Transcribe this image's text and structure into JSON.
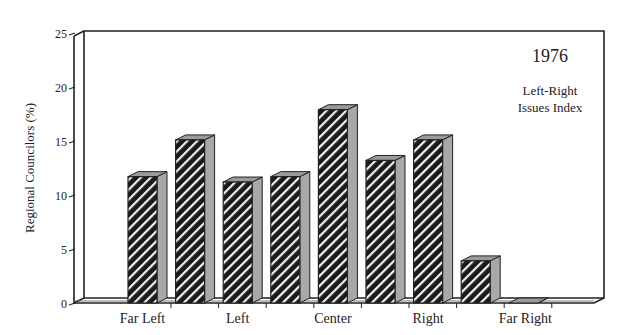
{
  "chart_data": {
    "type": "bar",
    "style": "3d-hatched",
    "title": "1976",
    "subtitle": "Left-Right Issues Index",
    "xlabel": "",
    "ylabel": "Regional Councilors (%)",
    "ylim": [
      0,
      25
    ],
    "yticks": [
      0,
      5,
      10,
      15,
      20,
      25
    ],
    "categories": [
      "1",
      "2",
      "3",
      "4",
      "5",
      "6",
      "7",
      "8",
      "9"
    ],
    "category_labels": [
      "Far Left",
      "",
      "Left",
      "",
      "Center",
      "",
      "Right",
      "",
      "Far Right"
    ],
    "values": [
      11.7,
      15.1,
      11.2,
      11.7,
      17.9,
      13.2,
      15.1,
      3.9,
      0
    ],
    "grid": false,
    "legend": null
  },
  "labels": {
    "ylabel": "Regional Councilors (%)",
    "year": "1976",
    "subtitle_line1": "Left-Right",
    "subtitle_line2": "Issues Index"
  }
}
